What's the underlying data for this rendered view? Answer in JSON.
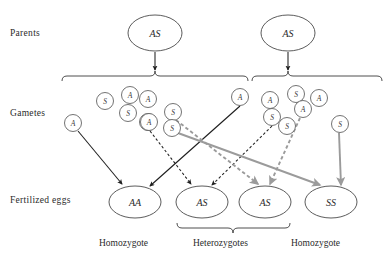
{
  "figure": {
    "type": "genetics-punnett-flow-diagram",
    "title": "",
    "row_labels": {
      "parents": "Parents",
      "gametes": "Gametes",
      "fertilized_eggs": "Fertilized eggs"
    },
    "zygosity_labels": {
      "homozygote_left": "Homozygote",
      "heterozygotes": "Heterozygotes",
      "homozygote_right": "Homozygote"
    },
    "colors": {
      "outline": "#4a4a4a",
      "text": "#2b2b2b",
      "arrow_dark": "#1f1f1f",
      "arrow_gray": "#9b9b9b",
      "background": "#ffffff"
    },
    "parents": [
      {
        "id": "parent-left",
        "genotype": "AS",
        "cx": 155,
        "cy": 33,
        "rx": 27,
        "ry": 18
      },
      {
        "id": "parent-right",
        "genotype": "AS",
        "cx": 288,
        "cy": 33,
        "rx": 27,
        "ry": 18
      }
    ],
    "gametes_left": [
      {
        "allele": "S",
        "cx": 105,
        "cy": 101,
        "r": 8.5
      },
      {
        "allele": "A",
        "cx": 130,
        "cy": 95,
        "r": 8.5
      },
      {
        "allele": "A",
        "cx": 148,
        "cy": 99,
        "r": 8.5
      },
      {
        "allele": "S",
        "cx": 128,
        "cy": 113,
        "r": 8.5
      },
      {
        "allele": "A",
        "cx": 73,
        "cy": 123,
        "r": 8.5
      },
      {
        "allele": "A",
        "cx": 148,
        "cy": 122,
        "r": 8.5
      },
      {
        "allele": "S",
        "cx": 173,
        "cy": 112,
        "r": 8.5
      },
      {
        "allele": "S",
        "cx": 172,
        "cy": 128,
        "r": 8.5
      },
      {
        "allele": "A",
        "cx": 149,
        "cy": 122,
        "r": 8.5
      }
    ],
    "gametes_right": [
      {
        "allele": "A",
        "cx": 240,
        "cy": 97,
        "r": 8.5
      },
      {
        "allele": "A",
        "cx": 270,
        "cy": 100,
        "r": 8.5
      },
      {
        "allele": "S",
        "cx": 296,
        "cy": 94,
        "r": 8.5
      },
      {
        "allele": "A",
        "cx": 319,
        "cy": 98,
        "r": 8.5
      },
      {
        "allele": "A",
        "cx": 303,
        "cy": 109,
        "r": 8.5
      },
      {
        "allele": "S",
        "cx": 272,
        "cy": 117,
        "r": 8.5
      },
      {
        "allele": "S",
        "cx": 287,
        "cy": 126,
        "r": 8.5
      },
      {
        "allele": "S",
        "cx": 340,
        "cy": 124,
        "r": 8.5
      }
    ],
    "fertilized_eggs": [
      {
        "id": "egg-aa",
        "genotype": "AA",
        "cx": 135,
        "cy": 202,
        "rx": 26,
        "ry": 16
      },
      {
        "id": "egg-as-1",
        "genotype": "AS",
        "cx": 202,
        "cy": 202,
        "rx": 26,
        "ry": 16
      },
      {
        "id": "egg-as-2",
        "genotype": "AS",
        "cx": 265,
        "cy": 202,
        "rx": 26,
        "ry": 16
      },
      {
        "id": "egg-ss",
        "genotype": "SS",
        "cx": 331,
        "cy": 202,
        "rx": 26,
        "ry": 16
      }
    ],
    "arrows": [
      {
        "id": "parent-left-to-gametes",
        "style": "solid-dark",
        "from": [
          155,
          52
        ],
        "to": [
          155,
          70
        ]
      },
      {
        "id": "parent-right-to-gametes",
        "style": "solid-dark",
        "from": [
          288,
          52
        ],
        "to": [
          288,
          70
        ]
      },
      {
        "id": "A-left-to-AA",
        "style": "solid-dark",
        "from": [
          78,
          131
        ],
        "to": [
          122,
          184
        ]
      },
      {
        "id": "A-right-to-AA",
        "style": "solid-dark",
        "from": [
          240,
          106
        ],
        "to": [
          150,
          186
        ]
      },
      {
        "id": "A-left-to-AS1",
        "style": "dashed-dark",
        "from": [
          150,
          131
        ],
        "to": [
          191,
          184
        ]
      },
      {
        "id": "S-right-to-AS1",
        "style": "dashed-dark",
        "from": [
          272,
          126
        ],
        "to": [
          212,
          185
        ]
      },
      {
        "id": "S-left-to-AS2",
        "style": "dashed-gray",
        "from": [
          176,
          120
        ],
        "to": [
          258,
          184
        ]
      },
      {
        "id": "A-right-to-AS2",
        "style": "dashed-gray",
        "from": [
          300,
          118
        ],
        "to": [
          270,
          184
        ]
      },
      {
        "id": "S-left-to-SS",
        "style": "solid-gray",
        "from": [
          178,
          133
        ],
        "to": [
          320,
          185
        ]
      },
      {
        "id": "S-right-to-SS",
        "style": "solid-gray",
        "from": [
          339,
          133
        ],
        "to": [
          341,
          185
        ]
      }
    ],
    "braces": [
      {
        "id": "brace-gametes-left",
        "orientation": "down",
        "x1": 62,
        "x2": 248,
        "y": 76,
        "tip_x": 155
      },
      {
        "id": "brace-gametes-right",
        "orientation": "down",
        "x1": 252,
        "x2": 382,
        "y": 76,
        "tip_x": 288
      },
      {
        "id": "brace-heterozygotes",
        "orientation": "up",
        "x1": 177,
        "x2": 290,
        "y": 228,
        "tip_x": 233
      }
    ]
  }
}
